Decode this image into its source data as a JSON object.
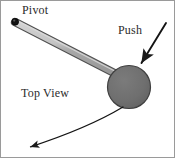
{
  "figure": {
    "background_color": "#ffffff",
    "border_color": "#8c8c8c",
    "labels": {
      "pivot": "Pivot",
      "push": "Push",
      "top_view": "Top View"
    },
    "colors": {
      "rod_highlight": "#c9c9c9",
      "rod_body": "#a6a6a6",
      "rod_outline": "#5a5a5a",
      "disk_fill": "#6f6f6f",
      "disk_outline": "#4a4a4a",
      "pivot_dot": "#1a1a1a",
      "arrow": "#1a1a1a",
      "text": "#2b2b2b"
    }
  },
  "diagram_data": {
    "type": "physics-schematic",
    "view": "top",
    "elements": [
      {
        "name": "pivot-point",
        "shape": "dot",
        "x": 15,
        "y": 22,
        "radius": 3.2,
        "label": "Pivot"
      },
      {
        "name": "rod",
        "shape": "bar",
        "start": [
          15,
          22
        ],
        "end": [
          120,
          76
        ],
        "thickness": 6
      },
      {
        "name": "disk",
        "shape": "circle",
        "center": [
          129,
          87
        ],
        "radius": 21.5
      },
      {
        "name": "push-force-arrow",
        "shape": "straight-arrow",
        "start": [
          166,
          24
        ],
        "end": [
          140,
          65
        ],
        "label": "Push",
        "direction": "down-left"
      },
      {
        "name": "motion-arc-arrow",
        "shape": "curved-arrow",
        "start": [
          122,
          107
        ],
        "control": [
          72,
          133
        ],
        "end": [
          29,
          147
        ],
        "direction": "counterclockwise-left"
      }
    ]
  }
}
